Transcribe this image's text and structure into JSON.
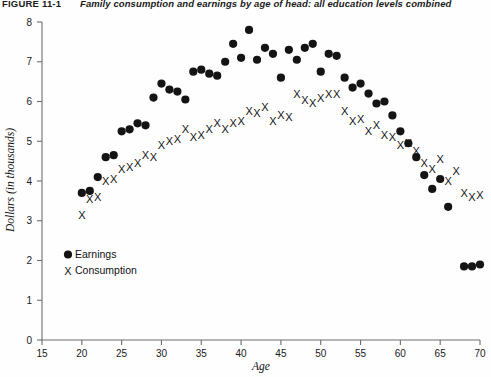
{
  "figure": {
    "label": "FIGURE 11-1",
    "title": "Family consumption and earnings by age of head: all education levels combined"
  },
  "chart_data": {
    "type": "scatter",
    "title": "Family consumption and earnings by age of head: all education levels combined",
    "xlabel": "Age",
    "ylabel": "Dollars (in thousands)",
    "xlim": [
      15,
      70
    ],
    "ylim": [
      0,
      8
    ],
    "xticks": [
      15,
      20,
      25,
      30,
      35,
      40,
      45,
      50,
      55,
      60,
      65,
      70
    ],
    "yticks": [
      0,
      1,
      2,
      3,
      4,
      5,
      6,
      7,
      8
    ],
    "grid": false,
    "legend_position": "lower-left",
    "series": [
      {
        "name": "Earnings",
        "marker": "filled-circle",
        "color": "#141414",
        "x": [
          20,
          21,
          22,
          23,
          24,
          25,
          26,
          27,
          28,
          29,
          30,
          31,
          32,
          33,
          34,
          35,
          36,
          37,
          38,
          39,
          40,
          41,
          42,
          43,
          44,
          45,
          46,
          47,
          48,
          49,
          50,
          51,
          52,
          53,
          54,
          55,
          56,
          57,
          58,
          59,
          60,
          61,
          62,
          63,
          64,
          65,
          66,
          68,
          69,
          70
        ],
        "y": [
          3.7,
          3.75,
          4.1,
          4.6,
          4.65,
          5.25,
          5.3,
          5.45,
          5.4,
          6.1,
          6.45,
          6.3,
          6.25,
          6.05,
          6.75,
          6.8,
          6.7,
          6.65,
          7.0,
          7.45,
          7.1,
          7.8,
          7.05,
          7.35,
          7.2,
          6.6,
          7.3,
          7.05,
          7.35,
          7.45,
          6.75,
          7.2,
          7.15,
          6.6,
          6.35,
          6.45,
          6.2,
          5.95,
          6.0,
          5.65,
          5.25,
          4.95,
          4.6,
          4.15,
          3.8,
          4.05,
          3.35,
          1.85,
          1.85,
          1.9
        ]
      },
      {
        "name": "Consumption",
        "marker": "x",
        "color": "#141414",
        "x": [
          20,
          21,
          22,
          23,
          24,
          25,
          26,
          27,
          28,
          29,
          30,
          31,
          32,
          33,
          34,
          35,
          36,
          37,
          38,
          39,
          40,
          41,
          42,
          43,
          44,
          45,
          46,
          47,
          48,
          49,
          50,
          51,
          52,
          53,
          54,
          55,
          56,
          57,
          58,
          59,
          60,
          61,
          62,
          63,
          64,
          65,
          66,
          67,
          68,
          69,
          70
        ],
        "y": [
          3.15,
          3.55,
          3.6,
          4.0,
          4.05,
          4.3,
          4.35,
          4.45,
          4.65,
          4.6,
          4.9,
          5.0,
          5.05,
          5.3,
          5.1,
          5.15,
          5.3,
          5.45,
          5.3,
          5.45,
          5.5,
          5.75,
          5.7,
          5.85,
          5.5,
          5.65,
          5.6,
          6.2,
          6.05,
          5.95,
          6.1,
          6.2,
          6.2,
          5.75,
          5.5,
          5.55,
          5.25,
          5.4,
          5.15,
          5.1,
          4.9,
          4.95,
          4.75,
          4.45,
          4.3,
          4.55,
          4.0,
          4.25,
          3.7,
          3.6,
          3.65
        ]
      }
    ]
  },
  "legend": {
    "entries": [
      {
        "label": "Earnings",
        "marker": "filled-circle"
      },
      {
        "label": "Consumption",
        "marker": "x"
      }
    ]
  }
}
